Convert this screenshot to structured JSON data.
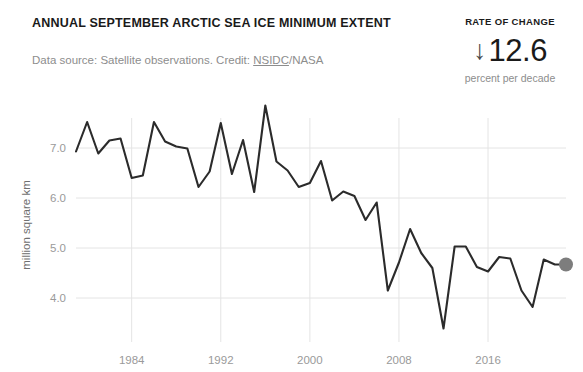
{
  "header": {
    "title": "ANNUAL SEPTEMBER ARCTIC SEA ICE MINIMUM EXTENT",
    "subtitle_prefix": "Data source: Satellite observations. Credit: ",
    "subtitle_link": "NSIDC",
    "subtitle_suffix": "/NASA"
  },
  "rate_of_change": {
    "label": "RATE OF CHANGE",
    "arrow": "↓",
    "value": "12.6",
    "unit": "percent per decade"
  },
  "chart_data": {
    "type": "line",
    "title": "ANNUAL SEPTEMBER ARCTIC SEA ICE MINIMUM EXTENT",
    "xlabel": "YEAR",
    "ylabel": "million square km",
    "xlim": [
      1979,
      2023
    ],
    "ylim": [
      3.2,
      7.75
    ],
    "grid": true,
    "legend": false,
    "xticks": [
      1984,
      1992,
      2000,
      2008,
      2016
    ],
    "xtick_labels": [
      "1984",
      "1992",
      "2000",
      "2008",
      "2016"
    ],
    "yticks": [
      4.0,
      5.0,
      6.0,
      7.0
    ],
    "ytick_labels": [
      "4.0",
      "5.0",
      "6.0",
      "7.0"
    ],
    "line_color": "#2b2b2b",
    "grid_color": "#e4e4e4",
    "endpoint_marker": {
      "color": "#7d7d7d",
      "year": 2023,
      "value": 4.67
    },
    "x": [
      1979,
      1980,
      1981,
      1982,
      1983,
      1984,
      1985,
      1986,
      1987,
      1988,
      1989,
      1990,
      1991,
      1992,
      1993,
      1994,
      1995,
      1996,
      1997,
      1998,
      1999,
      2000,
      2001,
      2002,
      2003,
      2004,
      2005,
      2006,
      2007,
      2008,
      2009,
      2010,
      2011,
      2012,
      2013,
      2014,
      2015,
      2016,
      2017,
      2018,
      2019,
      2020,
      2021,
      2022,
      2023
    ],
    "values": [
      6.93,
      7.52,
      6.89,
      7.15,
      7.19,
      6.4,
      6.45,
      7.52,
      7.13,
      7.03,
      6.99,
      6.22,
      6.53,
      7.5,
      6.48,
      7.16,
      6.12,
      7.85,
      6.73,
      6.55,
      6.22,
      6.3,
      6.74,
      5.95,
      6.13,
      6.04,
      5.56,
      5.91,
      4.15,
      4.71,
      5.38,
      4.9,
      4.6,
      3.39,
      5.03,
      5.03,
      4.62,
      4.53,
      4.82,
      4.79,
      4.15,
      3.82,
      4.77,
      4.67,
      4.67
    ],
    "series_name": "September Arctic sea ice minimum extent"
  }
}
